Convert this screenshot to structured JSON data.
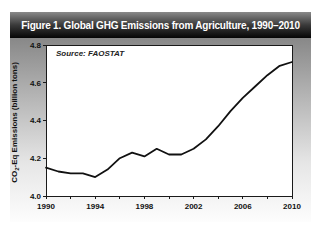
{
  "figure": {
    "title": "Figure 1. Global GHG Emissions from Agriculture, 1990–2010",
    "source_note": "Source: FAOSTAT"
  },
  "colors": {
    "titlebar_top": "#8a8a8a",
    "titlebar_bottom": "#050505",
    "title_text": "#ffffff",
    "body_gradient_top": "#888888",
    "body_gradient_bottom": "#fdfdfd",
    "plot_background": "#ffffff",
    "axis": "#1a1a1a",
    "line": "#111111"
  },
  "chart_data": {
    "type": "line",
    "title": "Figure 1. Global GHG Emissions from Agriculture, 1990–2010",
    "source": "Source: FAOSTAT",
    "xlabel": "",
    "ylabel": "CO2-Eq Emissions (billion tons)",
    "ylabel_parts": {
      "pre": "CO",
      "sub": "2",
      "post": "-Eq Emissions (billion tons)"
    },
    "series_name": "Global GHG emissions from agriculture",
    "x": [
      1990,
      1991,
      1992,
      1993,
      1994,
      1995,
      1996,
      1997,
      1998,
      1999,
      2000,
      2001,
      2002,
      2003,
      2004,
      2005,
      2006,
      2007,
      2008,
      2009,
      2010
    ],
    "values": [
      4.15,
      4.13,
      4.12,
      4.12,
      4.1,
      4.14,
      4.2,
      4.23,
      4.21,
      4.25,
      4.22,
      4.22,
      4.25,
      4.3,
      4.37,
      4.45,
      4.52,
      4.58,
      4.64,
      4.69,
      4.71
    ],
    "ylim": [
      4.0,
      4.8
    ],
    "xlim": [
      1990,
      2010
    ],
    "y_ticks": [
      4.0,
      4.2,
      4.4,
      4.6,
      4.8
    ],
    "y_tick_labels": [
      "4.0",
      "4.2",
      "4.4",
      "4.6",
      "4.8"
    ],
    "x_label_years": [
      1990,
      1994,
      1998,
      2002,
      2006,
      2010
    ],
    "x_tick_labels": [
      "1990",
      "1994",
      "1998",
      "2002",
      "2006",
      "2010"
    ],
    "x_minor_tick_years": [
      1990,
      1992,
      1994,
      1996,
      1998,
      2000,
      2002,
      2004,
      2006,
      2008,
      2010
    ],
    "grid": false,
    "legend": "none"
  }
}
